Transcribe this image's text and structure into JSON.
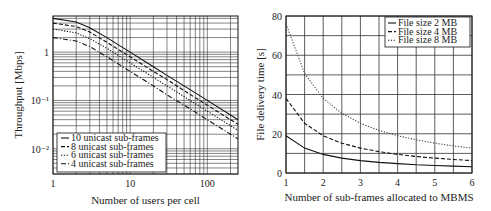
{
  "chart_data": [
    {
      "type": "line",
      "title": "",
      "xlabel": "Number of users per cell",
      "ylabel": "Throughput [Mbps]",
      "xscale": "log",
      "yscale": "log",
      "xlim": [
        1,
        250
      ],
      "ylim": [
        0.003,
        5.6
      ],
      "xticks": [
        1,
        10,
        100
      ],
      "xtick_labels": [
        "1",
        "10",
        "100"
      ],
      "yticks": [
        0.01,
        0.1,
        1
      ],
      "ytick_labels": [
        "10⁻²",
        "10⁻¹",
        "1"
      ],
      "grid": true,
      "legend_position": "lower left",
      "x": [
        1,
        2,
        3,
        5,
        10,
        20,
        30,
        50,
        100,
        200,
        250
      ],
      "series": [
        {
          "name": "10 unicast sub-frames",
          "style": "solid",
          "values": [
            5.0,
            4.2,
            3.2,
            2.0,
            1.0,
            0.5,
            0.33,
            0.2,
            0.1,
            0.05,
            0.04
          ]
        },
        {
          "name": "8 unicast sub-frames",
          "style": "dashed",
          "values": [
            4.0,
            3.4,
            2.6,
            1.6,
            0.8,
            0.4,
            0.27,
            0.16,
            0.08,
            0.04,
            0.032
          ]
        },
        {
          "name": "6 unicast sub-frames",
          "style": "dotted",
          "values": [
            3.0,
            2.5,
            1.9,
            1.2,
            0.6,
            0.3,
            0.2,
            0.12,
            0.06,
            0.03,
            0.024
          ]
        },
        {
          "name": "4 unicast sub-frames",
          "style": "dashdot",
          "values": [
            2.0,
            1.7,
            1.3,
            0.8,
            0.4,
            0.2,
            0.13,
            0.08,
            0.04,
            0.02,
            0.016
          ]
        }
      ]
    },
    {
      "type": "line",
      "title": "",
      "xlabel": "Number of sub-frames allocated to MBMS",
      "ylabel": "File delivery time [s]",
      "xlim": [
        1,
        6
      ],
      "ylim": [
        0,
        80
      ],
      "xticks": [
        1,
        2,
        3,
        4,
        5,
        6
      ],
      "yticks": [
        0,
        20,
        40,
        60,
        80
      ],
      "grid": true,
      "legend_position": "upper right",
      "x": [
        1,
        1.5,
        2,
        2.5,
        3,
        3.5,
        4,
        4.5,
        5,
        5.5,
        6
      ],
      "series": [
        {
          "name": "File size 2 MB",
          "style": "solid",
          "values": [
            19,
            12.7,
            9.5,
            7.6,
            6.3,
            5.4,
            4.8,
            4.2,
            3.8,
            3.5,
            3.2
          ]
        },
        {
          "name": "File size 4 MB",
          "style": "dashed",
          "values": [
            38,
            25.3,
            19,
            15.2,
            12.7,
            10.9,
            9.5,
            8.4,
            7.6,
            6.9,
            6.3
          ]
        },
        {
          "name": "File size 8 MB",
          "style": "dotted",
          "values": [
            76,
            50.7,
            38,
            30.4,
            25.3,
            21.7,
            19,
            16.9,
            15.2,
            13.8,
            12.7
          ]
        }
      ]
    }
  ]
}
